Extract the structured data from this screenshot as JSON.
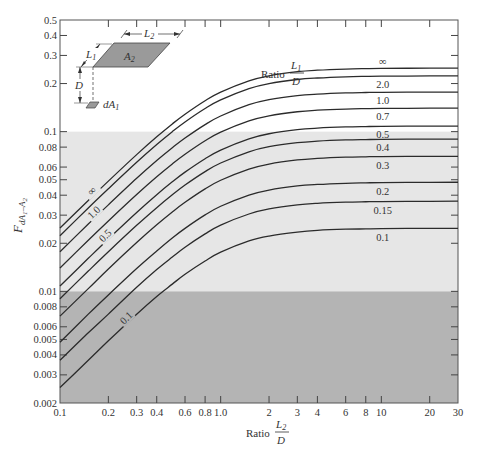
{
  "chart_data": {
    "type": "line",
    "title": "",
    "xlabel": "Ratio L2/D",
    "xlabel_parts": {
      "prefix": "Ratio",
      "num": "L",
      "num_sub": "2",
      "den": "D"
    },
    "ylabel": "F dA1-A2",
    "ylabel_parts": {
      "main": "F",
      "sub": "dA",
      "sub_sub": "1",
      "sub_rest": "–A",
      "sub_rest_sub": "2"
    },
    "xscale": "log",
    "yscale": "log",
    "xlim": [
      0.1,
      30
    ],
    "ylim": [
      0.002,
      0.5
    ],
    "grid": false,
    "x_ticks": [
      0.1,
      0.2,
      0.3,
      0.4,
      0.6,
      0.8,
      1.0,
      2,
      3,
      4,
      6,
      8,
      10,
      20,
      30
    ],
    "x_tick_labels": [
      "0.1",
      "0.2",
      "0.3",
      "0.4",
      "0.6",
      "0.8",
      "1.0",
      "2",
      "3",
      "4",
      "6",
      "8",
      "10",
      "20",
      "30"
    ],
    "y_ticks": [
      0.002,
      0.003,
      0.004,
      0.005,
      0.006,
      0.008,
      0.01,
      0.02,
      0.03,
      0.04,
      0.05,
      0.06,
      0.08,
      0.1,
      0.2,
      0.3,
      0.4,
      0.5
    ],
    "y_tick_labels": [
      "0.002",
      "0.003",
      "0.004",
      "0.005",
      "0.006",
      "0.008",
      "0.01",
      "0.02",
      "0.03",
      "0.04",
      "0.05",
      "0.06",
      "0.08",
      "0.1",
      "0.2",
      "0.3",
      "0.4",
      "0.5"
    ],
    "legend_title": {
      "prefix": "Ratio",
      "num": "L",
      "num_sub": "1",
      "den": "D"
    },
    "shading": [
      {
        "from": 0.01,
        "to": 0.1,
        "color": "#e6e6e6"
      },
      {
        "from": 0.002,
        "to": 0.01,
        "color": "#b4b4b4"
      }
    ],
    "x": [
      0.1,
      0.15,
      0.2,
      0.3,
      0.4,
      0.5,
      0.6,
      0.8,
      1.0,
      1.5,
      2,
      3,
      4,
      6,
      8,
      10,
      20,
      30
    ],
    "series": [
      {
        "name": "∞",
        "label": "∞",
        "values": [
          0.0249,
          0.0371,
          0.049,
          0.0718,
          0.0928,
          0.1118,
          0.1286,
          0.1562,
          0.1768,
          0.208,
          0.2236,
          0.2372,
          0.2425,
          0.2466,
          0.2481,
          0.2488,
          0.2497,
          0.2499
        ]
      },
      {
        "name": "2.0",
        "label": "2.0",
        "values": [
          0.0223,
          0.0333,
          0.0439,
          0.0643,
          0.0831,
          0.1,
          0.115,
          0.1396,
          0.158,
          0.1859,
          0.1999,
          0.212,
          0.2167,
          0.2205,
          0.2218,
          0.2224,
          0.2232,
          0.2234
        ]
      },
      {
        "name": "1.0",
        "label": "1.0",
        "values": [
          0.0177,
          0.0264,
          0.0348,
          0.051,
          0.0659,
          0.0793,
          0.0912,
          0.1107,
          0.1253,
          0.1474,
          0.1585,
          0.1681,
          0.1718,
          0.1748,
          0.1758,
          0.1763,
          0.1769,
          0.177
        ]
      },
      {
        "name": "0.7",
        "label": "0.7",
        "values": [
          0.014,
          0.0209,
          0.0276,
          0.0404,
          0.0522,
          0.0628,
          0.0722,
          0.0877,
          0.0993,
          0.1168,
          0.1256,
          0.1332,
          0.1362,
          0.1385,
          0.1393,
          0.1397,
          0.1402,
          0.1403
        ]
      },
      {
        "name": "0.5",
        "label": "0.5",
        "values": [
          0.0108,
          0.0161,
          0.0213,
          0.0312,
          0.0403,
          0.0485,
          0.0558,
          0.0677,
          0.0767,
          0.0902,
          0.097,
          0.1029,
          0.1052,
          0.107,
          0.1076,
          0.1079,
          0.1083,
          0.1084
        ]
      },
      {
        "name": "0.4",
        "label": "0.4",
        "values": [
          0.009,
          0.0134,
          0.0177,
          0.0259,
          0.0334,
          0.0402,
          0.0463,
          0.0562,
          0.0636,
          0.0748,
          0.0805,
          0.0853,
          0.0872,
          0.0887,
          0.0892,
          0.0895,
          0.0898,
          0.0899
        ]
      },
      {
        "name": "0.3",
        "label": "0.3",
        "values": [
          0.007,
          0.0104,
          0.0138,
          0.0202,
          0.0261,
          0.0314,
          0.0361,
          0.0438,
          0.0496,
          0.0583,
          0.0627,
          0.0665,
          0.068,
          0.0692,
          0.0696,
          0.0698,
          0.07,
          0.0701
        ]
      },
      {
        "name": "0.2",
        "label": "0.2",
        "values": [
          0.0048,
          0.0072,
          0.0095,
          0.0139,
          0.0179,
          0.0216,
          0.0248,
          0.0301,
          0.0341,
          0.0401,
          0.0431,
          0.0457,
          0.0467,
          0.0475,
          0.0478,
          0.048,
          0.0481,
          0.0482
        ]
      },
      {
        "name": "0.15",
        "label": "0.15",
        "values": [
          0.0037,
          0.0055,
          0.0072,
          0.0106,
          0.0137,
          0.0164,
          0.0189,
          0.0229,
          0.026,
          0.0305,
          0.0328,
          0.0348,
          0.0356,
          0.0362,
          0.0364,
          0.0365,
          0.0366,
          0.0367
        ]
      },
      {
        "name": "0.1",
        "label": "0.1",
        "values": [
          0.0025,
          0.0037,
          0.0049,
          0.0072,
          0.0093,
          0.0111,
          0.0128,
          0.0155,
          0.0176,
          0.0207,
          0.0222,
          0.0235,
          0.0241,
          0.0245,
          0.0246,
          0.0247,
          0.0248,
          0.0248
        ]
      }
    ],
    "inline_labels": [
      {
        "text": "∞",
        "series": "∞",
        "position": "left-diagonal"
      },
      {
        "text": "1.0",
        "series": "1.0",
        "position": "left-diagonal"
      },
      {
        "text": "0.5",
        "series": "0.5",
        "position": "left-diagonal"
      },
      {
        "text": "0.1",
        "series": "0.1",
        "position": "left-diagonal"
      }
    ],
    "inset_diagram": {
      "labels": {
        "L1": "L",
        "L1_sub": "1",
        "L2": "L",
        "L2_sub": "2",
        "A2": "A",
        "A2_sub": "2",
        "D": "D",
        "dA1": "dA",
        "dA1_sub": "1"
      }
    }
  }
}
